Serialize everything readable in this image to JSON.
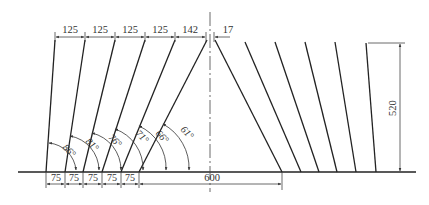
{
  "diagram": {
    "type": "technical-drawing",
    "colors": {
      "line": "#222222",
      "dim": "#444444",
      "background": "#ffffff"
    },
    "top_dimensions": [
      "125",
      "125",
      "125",
      "125",
      "142",
      "17"
    ],
    "bottom_dimensions": [
      "75",
      "75",
      "75",
      "75",
      "75"
    ],
    "span_dimension": "600",
    "height_dimension": "520",
    "angles": [
      "86°",
      "81°",
      "76°",
      "71°",
      "66°",
      "61°"
    ]
  }
}
